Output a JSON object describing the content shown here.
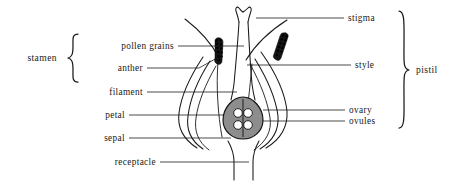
{
  "figure": {
    "type": "botanical-cross-section",
    "caption": "",
    "background_color": "#ffffff",
    "ink_color": "#1a1a1a",
    "ovary_fill_color": "#8d8d8d",
    "anther_fill_color": "#151515"
  },
  "groups": {
    "left": {
      "label": "stamen",
      "covers": [
        "pollen grains",
        "anther",
        "filament"
      ]
    },
    "right": {
      "label": "pistil",
      "covers": [
        "stigma",
        "style",
        "ovary",
        "ovules"
      ]
    }
  },
  "labels": {
    "left": [
      {
        "id": "pollen-grains",
        "text": "pollen grains",
        "in_group": true
      },
      {
        "id": "anther",
        "text": "anther",
        "in_group": true
      },
      {
        "id": "filament",
        "text": "filament",
        "in_group": true
      },
      {
        "id": "petal",
        "text": "petal",
        "in_group": false
      },
      {
        "id": "sepal",
        "text": "sepal",
        "in_group": false
      },
      {
        "id": "receptacle",
        "text": "receptacle",
        "in_group": false
      }
    ],
    "right": [
      {
        "id": "stigma",
        "text": "stigma",
        "in_group": true
      },
      {
        "id": "style",
        "text": "style",
        "in_group": true
      },
      {
        "id": "ovary",
        "text": "ovary",
        "in_group": true
      },
      {
        "id": "ovules",
        "text": "ovules",
        "in_group": true
      }
    ]
  },
  "parts": {
    "stigma": "forked bilobed tip at top of style",
    "style": "slender column from stigma to ovary",
    "ovary": "shaded teardrop chamber at flower base",
    "ovules": "two pale round bodies inside the ovary",
    "anther": "dark elongated pollen sac on filament tip",
    "filament": "slender curved stalk supporting anther",
    "petal": "inner curved perianth layer",
    "sepal": "outer curved perianth layer",
    "receptacle": "stem base supporting the flower"
  }
}
